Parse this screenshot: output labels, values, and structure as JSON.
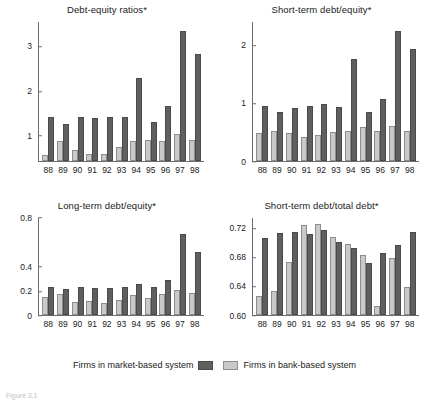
{
  "figure": {
    "caption": "Figure 3.1"
  },
  "legend": {
    "position": "bottom-center",
    "entries": [
      {
        "label": "Firms in market-based system",
        "color": "#5f5f5f",
        "swatch_side": "right"
      },
      {
        "label": "Firms in bank-based system",
        "color": "#c9c9c7",
        "swatch_side": "left"
      }
    ]
  },
  "series_names": [
    "Firms in bank-based system",
    "Firms in market-based system"
  ],
  "colors": {
    "market_based": "#5f5f5f",
    "bank_based": "#c9c9c7",
    "axis": "#6d6d6d",
    "text": "#1a1a1a"
  },
  "chart_data": [
    {
      "type": "bar",
      "title": "Debt-equity ratios*",
      "xlabel": "",
      "ylabel": "",
      "categories": [
        "88",
        "89",
        "90",
        "91",
        "92",
        "93",
        "94",
        "95",
        "96",
        "97",
        "98"
      ],
      "yticks": [
        1,
        2,
        3
      ],
      "ylim": [
        0.42,
        3.55
      ],
      "grid": false,
      "series": [
        {
          "name": "Firms in bank-based system",
          "color": "#c9c9c7",
          "values": [
            0.55,
            0.86,
            0.67,
            0.58,
            0.57,
            0.73,
            0.86,
            0.89,
            0.87,
            1.03,
            0.89
          ]
        },
        {
          "name": "Firms in market-based system",
          "color": "#5f5f5f",
          "values": [
            1.41,
            1.25,
            1.4,
            1.39,
            1.42,
            1.4,
            2.3,
            1.3,
            1.66,
            3.35,
            2.84
          ]
        }
      ]
    },
    {
      "type": "bar",
      "title": "Short-term debt/equity*",
      "xlabel": "",
      "ylabel": "",
      "categories": [
        "88",
        "89",
        "90",
        "91",
        "92",
        "93",
        "94",
        "95",
        "96",
        "97",
        "98"
      ],
      "yticks": [
        0,
        1,
        2
      ],
      "ylim": [
        0,
        2.4
      ],
      "grid": false,
      "series": [
        {
          "name": "Firms in bank-based system",
          "color": "#c9c9c7",
          "values": [
            0.48,
            0.52,
            0.49,
            0.41,
            0.45,
            0.5,
            0.52,
            0.59,
            0.52,
            0.61,
            0.52
          ]
        },
        {
          "name": "Firms in market-based system",
          "color": "#5f5f5f",
          "values": [
            0.95,
            0.84,
            0.91,
            0.95,
            0.98,
            0.93,
            1.77,
            0.84,
            1.07,
            2.25,
            1.93
          ]
        }
      ]
    },
    {
      "type": "bar",
      "title": "Long-term debt/equity*",
      "xlabel": "",
      "ylabel": "",
      "categories": [
        "88",
        "89",
        "90",
        "91",
        "92",
        "93",
        "94",
        "95",
        "96",
        "97",
        "98"
      ],
      "yticks": [
        0,
        0.2,
        0.4,
        0.8
      ],
      "ytick_labels": [
        "0",
        "0.2",
        "0.4",
        "0.8"
      ],
      "ylim": [
        0,
        0.8
      ],
      "grid": false,
      "series": [
        {
          "name": "Firms in bank-based system",
          "color": "#c9c9c7",
          "values": [
            0.152,
            0.171,
            0.108,
            0.116,
            0.096,
            0.121,
            0.166,
            0.139,
            0.173,
            0.206,
            0.18
          ]
        },
        {
          "name": "Firms in market-based system",
          "color": "#5f5f5f",
          "values": [
            0.234,
            0.213,
            0.234,
            0.221,
            0.22,
            0.227,
            0.257,
            0.23,
            0.288,
            0.668,
            0.521
          ]
        }
      ]
    },
    {
      "type": "bar",
      "title": "Short-term debt/total debt*",
      "xlabel": "",
      "ylabel": "",
      "categories": [
        "88",
        "89",
        "90",
        "91",
        "92",
        "93",
        "94",
        "95",
        "96",
        "97",
        "98"
      ],
      "yticks": [
        0.6,
        0.64,
        0.68,
        0.72
      ],
      "ytick_labels": [
        "0.60",
        "0.64",
        "0.68",
        "0.72"
      ],
      "ylim": [
        0.6,
        0.735
      ],
      "grid": false,
      "series": [
        {
          "name": "Firms in bank-based system",
          "color": "#c9c9c7",
          "values": [
            0.627,
            0.634,
            0.674,
            0.725,
            0.727,
            0.709,
            0.699,
            0.683,
            0.613,
            0.679,
            0.639
          ]
        },
        {
          "name": "Firms in market-based system",
          "color": "#5f5f5f",
          "values": [
            0.707,
            0.714,
            0.715,
            0.713,
            0.718,
            0.702,
            0.693,
            0.672,
            0.686,
            0.698,
            0.716
          ]
        }
      ]
    }
  ]
}
